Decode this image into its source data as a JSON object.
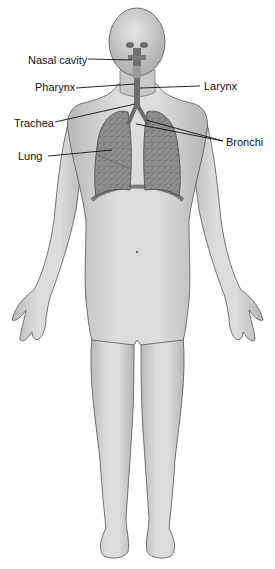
{
  "diagram": {
    "labels": [
      {
        "id": "nasal-cavity",
        "text": "Nasal cavity",
        "x": 28,
        "y": 54
      },
      {
        "id": "pharynx",
        "text": "Pharynx",
        "x": 35,
        "y": 81
      },
      {
        "id": "larynx",
        "text": "Larynx",
        "x": 204,
        "y": 80
      },
      {
        "id": "trachea",
        "text": "Trachea",
        "x": 14,
        "y": 117
      },
      {
        "id": "bronchi",
        "text": "Bronchi",
        "x": 226,
        "y": 136
      },
      {
        "id": "lung",
        "text": "Lung",
        "x": 18,
        "y": 150
      }
    ],
    "colors": {
      "skin": "#d4d4d4",
      "skin_shadow": "#a8a8a8",
      "outline": "#555555",
      "lung": "#8c8c8c",
      "airway": "#6a6a6a",
      "leader": "#111111"
    }
  }
}
